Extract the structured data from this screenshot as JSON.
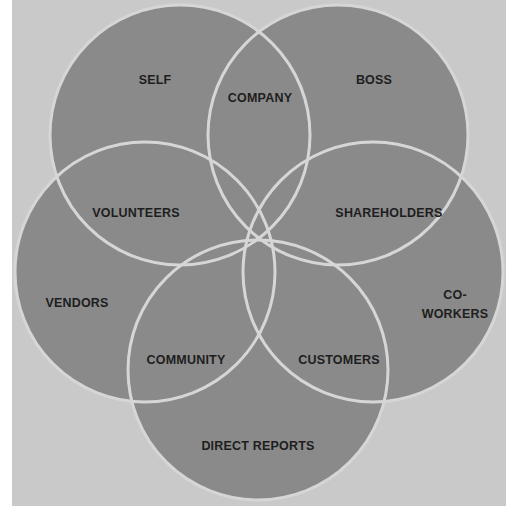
{
  "diagram": {
    "type": "venn",
    "colors": {
      "background": "#c9c9c9",
      "circle_fill": "#8a8a8a",
      "circle_stroke": "#d6d6d6",
      "text": "#1e1e1e"
    },
    "circles": [
      {
        "id": "top-left",
        "cx": 180,
        "cy": 135,
        "r": 130
      },
      {
        "id": "top-right",
        "cx": 338,
        "cy": 135,
        "r": 130
      },
      {
        "id": "left",
        "cx": 145,
        "cy": 272,
        "r": 130
      },
      {
        "id": "right",
        "cx": 373,
        "cy": 272,
        "r": 130
      },
      {
        "id": "bottom",
        "cx": 258,
        "cy": 370,
        "r": 130
      }
    ],
    "labels": {
      "self": "SELF",
      "company": "COMPANY",
      "boss": "BOSS",
      "volunteers": "VOLUNTEERS",
      "shareholders": "SHAREHOLDERS",
      "vendors": "VENDORS",
      "coworkers_line1": "CO-",
      "coworkers_line2": "WORKERS",
      "community": "COMMUNITY",
      "customers": "CUSTOMERS",
      "direct_reports": "DIRECT REPORTS"
    }
  }
}
